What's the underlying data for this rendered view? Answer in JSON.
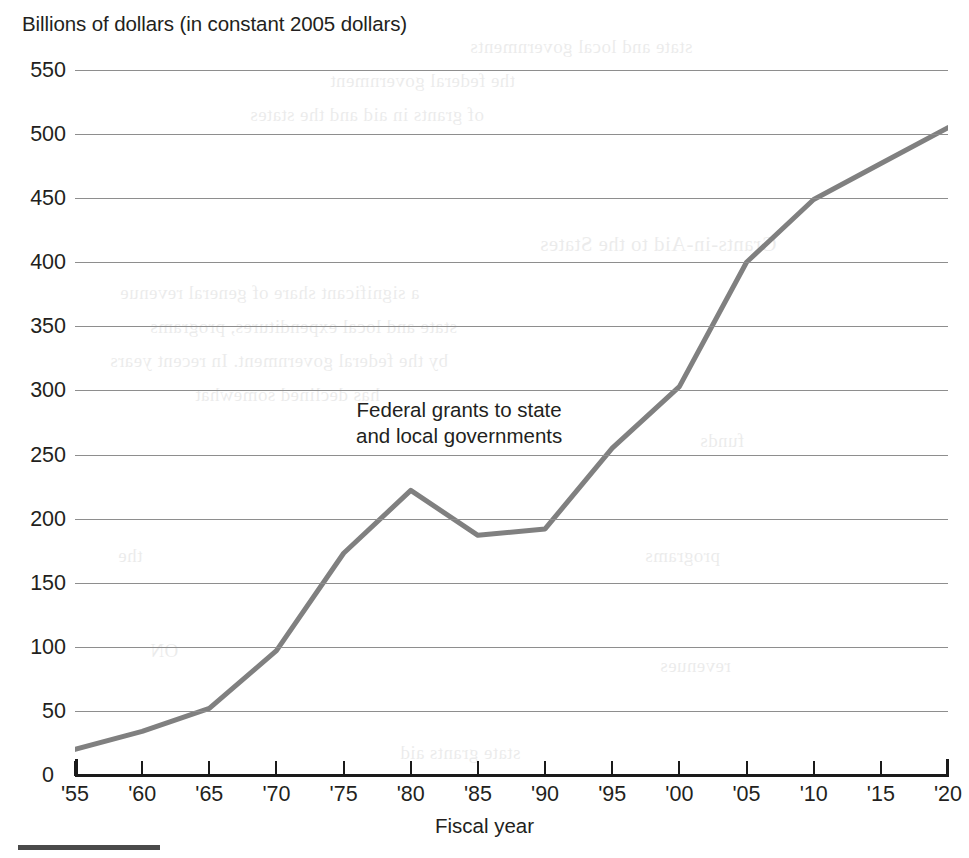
{
  "chart_data": {
    "type": "line",
    "title": "Billions of dollars (in constant 2005 dollars)",
    "xlabel": "Fiscal year",
    "ylabel": "",
    "annotation": "Federal grants to state\nand local governments",
    "series_name": "Federal grants to state and local governments",
    "line_color": "#808080",
    "grid": true,
    "legend_position": "inline-annotation",
    "ylim": [
      0,
      550
    ],
    "xlim": [
      1955,
      2020
    ],
    "y_ticks": [
      550,
      500,
      450,
      400,
      350,
      300,
      250,
      200,
      150,
      100,
      50,
      0
    ],
    "y_tick_labels": [
      "550",
      "500",
      "450",
      "400",
      "350",
      "300",
      "250",
      "200",
      "150",
      "100",
      "50",
      "0"
    ],
    "x_tick_labels": [
      "'55",
      "'60",
      "'65",
      "'70",
      "'75",
      "'80",
      "'85",
      "'90",
      "'95",
      "'00",
      "'05",
      "'10",
      "'15",
      "'20"
    ],
    "x": [
      1955,
      1960,
      1965,
      1970,
      1975,
      1980,
      1985,
      1990,
      1995,
      2000,
      2005,
      2010,
      2015,
      2020
    ],
    "values": [
      20,
      34,
      52,
      97,
      173,
      222,
      187,
      192,
      255,
      303,
      400,
      449,
      477,
      505
    ],
    "categories": [
      "'55",
      "'60",
      "'65",
      "'70",
      "'75",
      "'80",
      "'85",
      "'90",
      "'95",
      "'00",
      "'05",
      "'10",
      "'15",
      "'20"
    ]
  },
  "ghost_text": [
    {
      "t": "state and local governments",
      "x": 470,
      "y": 36,
      "s": 19
    },
    {
      "t": "the federal government",
      "x": 330,
      "y": 70,
      "s": 19
    },
    {
      "t": "of grants in aid and the states",
      "x": 250,
      "y": 104,
      "s": 19
    },
    {
      "t": "Grants-in-Aid to the States",
      "x": 540,
      "y": 232,
      "s": 21
    },
    {
      "t": "a significant share of general revenue",
      "x": 120,
      "y": 282,
      "s": 19
    },
    {
      "t": "state and local expenditures, programs",
      "x": 150,
      "y": 316,
      "s": 19
    },
    {
      "t": "by the federal government. In recent years",
      "x": 110,
      "y": 350,
      "s": 19
    },
    {
      "t": "has declined somewhat",
      "x": 195,
      "y": 384,
      "s": 19
    },
    {
      "t": "funds",
      "x": 700,
      "y": 430,
      "s": 19
    },
    {
      "t": "the",
      "x": 118,
      "y": 545,
      "s": 19
    },
    {
      "t": "programs",
      "x": 645,
      "y": 545,
      "s": 19
    },
    {
      "t": "ON",
      "x": 150,
      "y": 640,
      "s": 19
    },
    {
      "t": "revenues",
      "x": 660,
      "y": 655,
      "s": 19
    },
    {
      "t": "state grants aid",
      "x": 400,
      "y": 742,
      "s": 19
    }
  ]
}
